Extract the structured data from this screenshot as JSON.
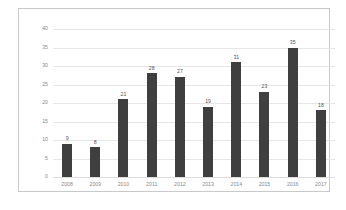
{
  "chart_data": {
    "type": "bar",
    "title": "",
    "subtitle": "",
    "xlabel": "",
    "ylabel": "",
    "categories": [
      "2008",
      "2009",
      "2010",
      "2011",
      "2012",
      "2013",
      "2014",
      "2015",
      "2016",
      "2017"
    ],
    "values": [
      9,
      8,
      21,
      28,
      27,
      19,
      31,
      23,
      35,
      18
    ],
    "data_labels": [
      "9",
      "8",
      "21",
      "28",
      "27",
      "19",
      "31",
      "23",
      "35",
      "18"
    ],
    "ylim": [
      0,
      40
    ],
    "ytick_values": [
      0,
      5,
      10,
      15,
      20,
      25,
      30,
      35,
      40
    ],
    "ytick_labels": [
      "0",
      "5",
      "10",
      "15",
      "20",
      "25",
      "30",
      "35",
      "40"
    ],
    "grid": "horizontal",
    "legend": "none",
    "bar_color": "#3f3f3f",
    "gridline_color": "#e6e6e6",
    "tick_label_color": "#8a8a8a",
    "data_label_color": "#555555",
    "plot_background": "#ffffff",
    "border_color": "#c9c9c9"
  }
}
